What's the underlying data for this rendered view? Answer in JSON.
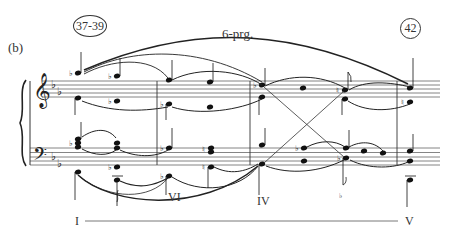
{
  "figure": {
    "part_label": "(b)",
    "measure_start": "37-39",
    "measure_end": "42",
    "progression_label": "6-prg.",
    "roman_numerals": {
      "I": "I",
      "VI": "VI",
      "IV": "IV",
      "V": "V"
    },
    "clefs": [
      "treble",
      "bass"
    ],
    "key_signature": "2 flats (B♭, E♭)",
    "colors": {
      "ink": "#222222",
      "staff": "#555555",
      "background": "#ffffff"
    },
    "glyphs": {
      "treble_clef": "𝄞",
      "bass_clef": "𝄢",
      "flat": "♭",
      "natural": "♮"
    }
  }
}
